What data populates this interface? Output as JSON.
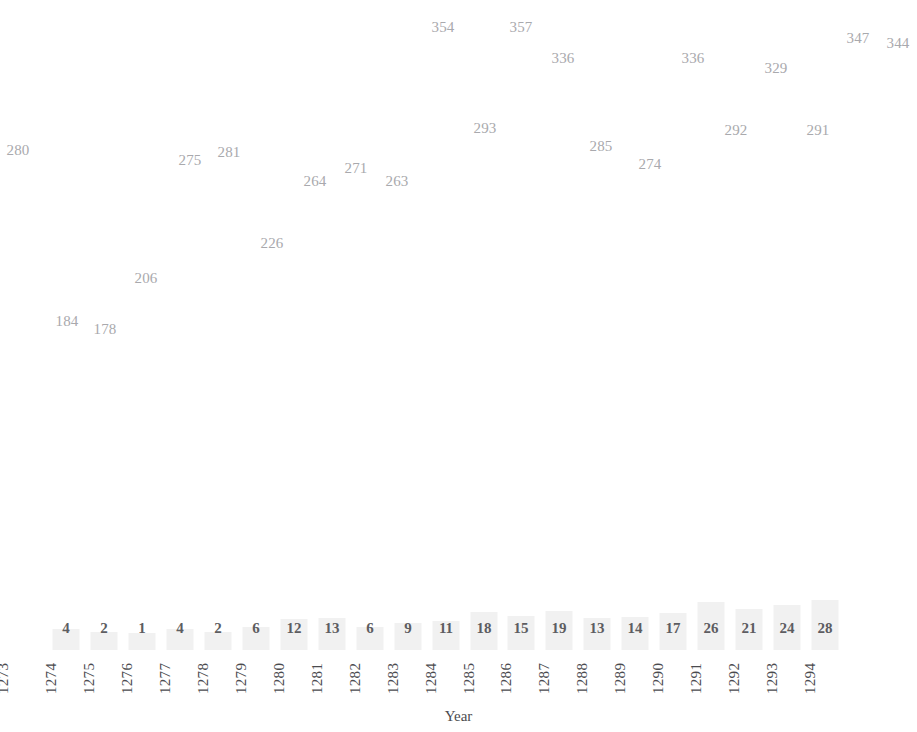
{
  "chart_data": {
    "type": "scatter",
    "title": "",
    "subtitle": "",
    "xlabel": "Year",
    "ylabel": "",
    "grid": false,
    "legend": null,
    "x": [
      1273,
      1274,
      1275,
      1276,
      1277,
      1278,
      1279,
      1280,
      1281,
      1282,
      1283,
      1284,
      1285,
      1286,
      1287,
      1288,
      1289,
      1290,
      1291,
      1292,
      1293,
      1294
    ],
    "categories": [
      "1273",
      "1274",
      "1275",
      "1276",
      "1277",
      "1278",
      "1279",
      "1280",
      "1281",
      "1282",
      "1283",
      "1284",
      "1285",
      "1286",
      "1287",
      "1288",
      "1289",
      "1290",
      "1291",
      "1292",
      "1293",
      "1294"
    ],
    "series": [
      {
        "name": "value",
        "values": [
          280,
          184,
          178,
          206,
          275,
          281,
          226,
          264,
          271,
          263,
          354,
          357,
          293,
          336,
          285,
          274,
          336,
          292,
          329,
          291,
          347,
          344
        ]
      },
      {
        "name": "count",
        "values": [
          null,
          4,
          2,
          1,
          4,
          2,
          6,
          12,
          13,
          6,
          9,
          11,
          18,
          15,
          19,
          13,
          14,
          17,
          26,
          21,
          24,
          28
        ]
      }
    ],
    "value_label_points": [
      {
        "text": "280",
        "x": 18,
        "y": 150
      },
      {
        "text": "184",
        "x": 67,
        "y": 321
      },
      {
        "text": "178",
        "x": 105,
        "y": 329
      },
      {
        "text": "206",
        "x": 146,
        "y": 278
      },
      {
        "text": "275",
        "x": 190,
        "y": 160
      },
      {
        "text": "281",
        "x": 229,
        "y": 152
      },
      {
        "text": "226",
        "x": 272,
        "y": 243
      },
      {
        "text": "264",
        "x": 315,
        "y": 181
      },
      {
        "text": "271",
        "x": 356,
        "y": 168
      },
      {
        "text": "263",
        "x": 397,
        "y": 181
      },
      {
        "text": "354",
        "x": 443,
        "y": 27
      },
      {
        "text": "357",
        "x": 521,
        "y": 27
      },
      {
        "text": "293",
        "x": 485,
        "y": 128
      },
      {
        "text": "336",
        "x": 563,
        "y": 58
      },
      {
        "text": "285",
        "x": 601,
        "y": 146
      },
      {
        "text": "274",
        "x": 650,
        "y": 164
      },
      {
        "text": "336",
        "x": 693,
        "y": 58
      },
      {
        "text": "292",
        "x": 736,
        "y": 130
      },
      {
        "text": "329",
        "x": 776,
        "y": 68
      },
      {
        "text": "291",
        "x": 818,
        "y": 130
      },
      {
        "text": "347",
        "x": 858,
        "y": 38
      },
      {
        "text": "344",
        "x": 898,
        "y": 43
      }
    ],
    "count_labels": [
      {
        "text": "",
        "x": 18,
        "bar": 0
      },
      {
        "text": "4",
        "x": 66,
        "bar": 4
      },
      {
        "text": "2",
        "x": 104,
        "bar": 2
      },
      {
        "text": "1",
        "x": 142,
        "bar": 1
      },
      {
        "text": "4",
        "x": 180,
        "bar": 4
      },
      {
        "text": "2",
        "x": 218,
        "bar": 2
      },
      {
        "text": "6",
        "x": 256,
        "bar": 6
      },
      {
        "text": "12",
        "x": 294,
        "bar": 12
      },
      {
        "text": "13",
        "x": 332,
        "bar": 13
      },
      {
        "text": "6",
        "x": 370,
        "bar": 6
      },
      {
        "text": "9",
        "x": 408,
        "bar": 9
      },
      {
        "text": "11",
        "x": 446,
        "bar": 11
      },
      {
        "text": "18",
        "x": 484,
        "bar": 18
      },
      {
        "text": "15",
        "x": 521,
        "bar": 15
      },
      {
        "text": "19",
        "x": 559,
        "bar": 19
      },
      {
        "text": "13",
        "x": 597,
        "bar": 13
      },
      {
        "text": "14",
        "x": 635,
        "bar": 14
      },
      {
        "text": "17",
        "x": 673,
        "bar": 17
      },
      {
        "text": "26",
        "x": 711,
        "bar": 26
      },
      {
        "text": "21",
        "x": 749,
        "bar": 21
      },
      {
        "text": "24",
        "x": 787,
        "bar": 24
      },
      {
        "text": "28",
        "x": 825,
        "bar": 28
      }
    ],
    "tick_positions": [
      18,
      56,
      94,
      132,
      170,
      208,
      246,
      284,
      322,
      360,
      398,
      436,
      474,
      512,
      550,
      588,
      626,
      664,
      702,
      740,
      778,
      816
    ],
    "colors": {
      "value_label": "#a9a9ad",
      "count_label": "#5d5d61",
      "tick_label": "#4b4b4f",
      "bar_fill": "#f1f1f1",
      "background": "#ffffff"
    }
  },
  "axis": {
    "x_title": "Year"
  }
}
